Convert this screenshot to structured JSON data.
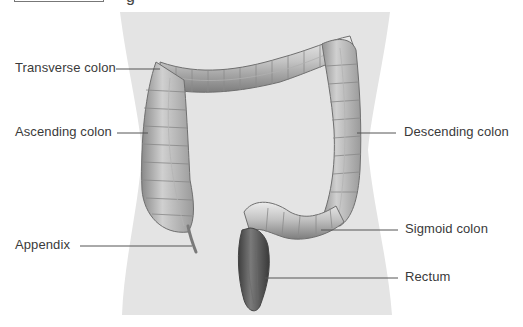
{
  "figure": {
    "caption_fragment": "g",
    "labels": [
      {
        "id": "transverse",
        "text": "Transverse colon",
        "x": 15,
        "y": 60,
        "line": [
          116,
          69,
          160,
          69
        ]
      },
      {
        "id": "ascending",
        "text": "Ascending colon",
        "x": 15,
        "y": 124,
        "line": [
          117,
          133,
          148,
          133
        ]
      },
      {
        "id": "descending",
        "text": "Descending colon",
        "x": 404,
        "y": 124,
        "line": [
          357,
          133,
          396,
          133
        ]
      },
      {
        "id": "appendix",
        "text": "Appendix",
        "x": 15,
        "y": 237,
        "line": [
          80,
          246,
          192,
          246
        ]
      },
      {
        "id": "sigmoid",
        "text": "Sigmoid colon",
        "x": 405,
        "y": 221,
        "line": [
          321,
          230,
          398,
          230
        ]
      },
      {
        "id": "rectum",
        "text": "Rectum",
        "x": 405,
        "y": 269,
        "line": [
          265,
          278,
          398,
          278
        ]
      }
    ]
  },
  "colors": {
    "torso": "#e4e4e4",
    "colon_light": "#d6d6d6",
    "colon_mid": "#a9a9a9",
    "colon_dark": "#6e6e6e",
    "rectum": "#555555",
    "label_text": "#3a3a3a",
    "leader_line": "#555555"
  }
}
